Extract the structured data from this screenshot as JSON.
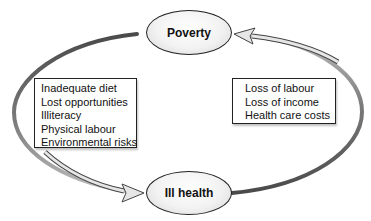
{
  "diagram": {
    "type": "cycle",
    "nodes": {
      "top": {
        "label": "Poverty"
      },
      "bottom": {
        "label": "Ill health"
      }
    },
    "left_box": {
      "items": [
        "Inadequate diet",
        "Lost opportunities",
        "Illiteracy",
        "Physical labour",
        "Environmental risks"
      ]
    },
    "right_box": {
      "items": [
        "Loss of labour",
        "Loss of income",
        "Health care costs"
      ]
    },
    "edges": [
      {
        "from": "Poverty",
        "to": "Ill health",
        "side": "left"
      },
      {
        "from": "Ill health",
        "to": "Poverty",
        "side": "right"
      }
    ],
    "colors": {
      "arc_dark": "#555555",
      "arrow_fill": "#e6e6e6",
      "outline": "#222222"
    }
  }
}
